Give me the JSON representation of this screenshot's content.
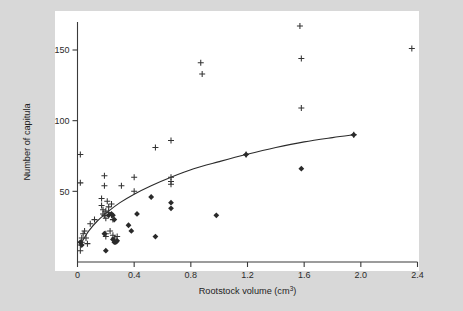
{
  "figure": {
    "background_color": "#d8d8d8",
    "plot_background_color": "#ffffff",
    "axis_color": "#3a3a3a",
    "marker_color": "#2a2a2a"
  },
  "chart_data": {
    "type": "scatter",
    "title": "",
    "xlabel": "Rootstock volume (cm3)",
    "xlabel_base": "Rootstock volume (cm",
    "xlabel_sup": "3",
    "xlabel_tail": ")",
    "ylabel": "Number of capitula",
    "xlim": [
      0,
      2.4
    ],
    "ylim": [
      0,
      172
    ],
    "xticks": [
      0,
      0.4,
      0.8,
      1.2,
      1.6,
      2.0,
      2.4
    ],
    "xticklabels": [
      "0",
      "0.4",
      "0.8",
      "1.2",
      "1.6",
      "2.0",
      "2.4"
    ],
    "yticks": [
      50,
      100,
      150
    ],
    "yticklabels": [
      "50",
      "100",
      "150"
    ],
    "grid": false,
    "legend": "none",
    "series": [
      {
        "name": "plus-markers",
        "marker": "plus",
        "points": [
          [
            0.02,
            8
          ],
          [
            0.02,
            12
          ],
          [
            0.03,
            14
          ],
          [
            0.03,
            17
          ],
          [
            0.04,
            20
          ],
          [
            0.02,
            56
          ],
          [
            0.02,
            76
          ],
          [
            0.05,
            22
          ],
          [
            0.06,
            17
          ],
          [
            0.07,
            13
          ],
          [
            0.09,
            27
          ],
          [
            0.12,
            30
          ],
          [
            0.17,
            45
          ],
          [
            0.17,
            40
          ],
          [
            0.18,
            37
          ],
          [
            0.18,
            34
          ],
          [
            0.19,
            61
          ],
          [
            0.19,
            54
          ],
          [
            0.19,
            33
          ],
          [
            0.2,
            36
          ],
          [
            0.2,
            31
          ],
          [
            0.2,
            20
          ],
          [
            0.2,
            18
          ],
          [
            0.21,
            43
          ],
          [
            0.22,
            39
          ],
          [
            0.22,
            35
          ],
          [
            0.23,
            22
          ],
          [
            0.24,
            41
          ],
          [
            0.24,
            33
          ],
          [
            0.25,
            30
          ],
          [
            0.25,
            19
          ],
          [
            0.26,
            17
          ],
          [
            0.28,
            18
          ],
          [
            0.31,
            54
          ],
          [
            0.4,
            60
          ],
          [
            0.4,
            50
          ],
          [
            0.55,
            81
          ],
          [
            0.66,
            86
          ],
          [
            0.66,
            60
          ],
          [
            0.66,
            57
          ],
          [
            0.66,
            55
          ],
          [
            0.87,
            141
          ],
          [
            0.88,
            133
          ],
          [
            1.19,
            76
          ],
          [
            1.57,
            167
          ],
          [
            1.58,
            144
          ],
          [
            1.58,
            109
          ],
          [
            1.95,
            90
          ],
          [
            2.36,
            151
          ]
        ]
      },
      {
        "name": "diamond-markers",
        "marker": "diamond",
        "points": [
          [
            0.02,
            14
          ],
          [
            0.03,
            12
          ],
          [
            0.19,
            20
          ],
          [
            0.2,
            8
          ],
          [
            0.22,
            33
          ],
          [
            0.24,
            34
          ],
          [
            0.25,
            33
          ],
          [
            0.25,
            16
          ],
          [
            0.26,
            30
          ],
          [
            0.26,
            14
          ],
          [
            0.27,
            14
          ],
          [
            0.28,
            15
          ],
          [
            0.36,
            26
          ],
          [
            0.38,
            22
          ],
          [
            0.42,
            34
          ],
          [
            0.52,
            46
          ],
          [
            0.55,
            18
          ],
          [
            0.66,
            42
          ],
          [
            0.66,
            38
          ],
          [
            0.98,
            33
          ],
          [
            1.19,
            76
          ],
          [
            1.58,
            66
          ],
          [
            1.95,
            90
          ]
        ]
      }
    ],
    "fit_curve": {
      "name": "fitted-curve",
      "description": "monotonic saturating fit through the data",
      "points": [
        [
          0.03,
          14
        ],
        [
          0.08,
          22
        ],
        [
          0.14,
          29
        ],
        [
          0.22,
          36
        ],
        [
          0.3,
          42
        ],
        [
          0.4,
          48
        ],
        [
          0.52,
          54
        ],
        [
          0.66,
          60
        ],
        [
          0.82,
          66
        ],
        [
          1.0,
          71
        ],
        [
          1.19,
          76
        ],
        [
          1.4,
          81
        ],
        [
          1.6,
          85
        ],
        [
          1.8,
          88
        ],
        [
          1.95,
          90
        ]
      ]
    }
  }
}
